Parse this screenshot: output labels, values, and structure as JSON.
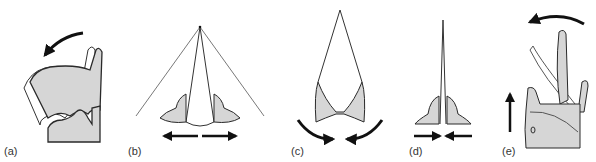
{
  "figure": {
    "panels": [
      {
        "id": "a",
        "label": "(a)",
        "description": "Thyroid cartilage tilting forward over cricoid, curved arrow counter-clockwise"
      },
      {
        "id": "b",
        "label": "(b)",
        "description": "Arytenoid cartilages abducted, vocal folds form wide V from anterior point, double-headed horizontal arrow"
      },
      {
        "id": "c",
        "label": "(c)",
        "description": "Arytenoids rotating medially, curved arrows pointing inward"
      },
      {
        "id": "d",
        "label": "(d)",
        "description": "Arytenoids adducted, vocal folds closed, arrows pointing toward midline"
      },
      {
        "id": "e",
        "label": "(e)",
        "description": "Cricoid rising (upward arrow), thyroid rotation arrow at top"
      }
    ],
    "colors": {
      "fill": "#d6d6d6",
      "stroke": "#2a2a2a",
      "arrow": "#111111",
      "background": "#ffffff"
    }
  }
}
